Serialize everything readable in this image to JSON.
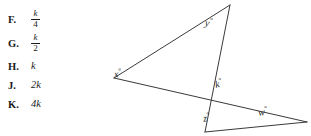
{
  "choices": [
    {
      "letter": "F.",
      "type": "fraction",
      "numerator": "k",
      "denominator": "4",
      "text": "k/4"
    },
    {
      "letter": "G.",
      "type": "fraction",
      "numerator": "k",
      "denominator": "2",
      "text": "k/2"
    },
    {
      "letter": "H.",
      "type": "plain",
      "text": "k"
    },
    {
      "letter": "J.",
      "type": "plain",
      "text": "2k"
    },
    {
      "letter": "K.",
      "type": "plain",
      "text": "4k"
    }
  ],
  "figure": {
    "angle_labels": [
      {
        "id": "x",
        "text": "x",
        "degree": "°"
      },
      {
        "id": "y",
        "text": "y",
        "degree": "°"
      },
      {
        "id": "k",
        "text": "k",
        "degree": "°"
      },
      {
        "id": "z",
        "text": "z",
        "degree": "°"
      },
      {
        "id": "w",
        "text": "w",
        "degree": "°"
      }
    ],
    "stroke_color": "#3a3a3a"
  },
  "colors": {
    "background": "#ffffff",
    "ink": "#1a1a1a",
    "line": "#3a3a3a"
  }
}
